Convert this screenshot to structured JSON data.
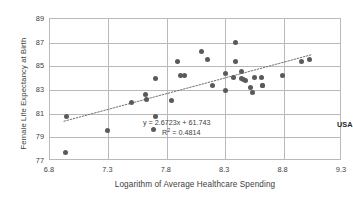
{
  "chart_data": {
    "type": "scatter",
    "title": "",
    "xlabel": "Logarithm of Average Healthcare Spending",
    "ylabel": "Female Life Expectancy at Birth",
    "xlim": [
      6.8,
      9.3
    ],
    "ylim": [
      77,
      89
    ],
    "xticks": [
      "6.8",
      "7.3",
      "7.8",
      "8.3",
      "8.8",
      "9.3"
    ],
    "yticks": [
      "89",
      "87",
      "85",
      "83",
      "81",
      "79",
      "77"
    ],
    "grid": "both",
    "legend": "none",
    "annotations": [
      {
        "name": "regression-equation",
        "text": "y = 2.6723x + 61.743",
        "x": 7.6,
        "y": 80.95
      },
      {
        "name": "r-squared",
        "text": "R² = 0.4814",
        "x": 7.77,
        "y": 80.18
      },
      {
        "name": "usa-label",
        "text": "USA",
        "x": 8.82,
        "y": 80.75
      }
    ],
    "trendline": {
      "type": "linear-dotted",
      "slope": 2.6723,
      "intercept": 61.743,
      "x_start": 6.92,
      "x_end": 9.06
    },
    "series": [
      {
        "name": "Countries",
        "marker": "circle",
        "color": "#5a5a5a",
        "points": [
          {
            "x": 6.93,
            "y": 77.75
          },
          {
            "x": 6.94,
            "y": 80.75
          },
          {
            "x": 7.29,
            "y": 79.55
          },
          {
            "x": 7.5,
            "y": 81.95
          },
          {
            "x": 7.62,
            "y": 82.65
          },
          {
            "x": 7.63,
            "y": 82.2
          },
          {
            "x": 7.7,
            "y": 83.95
          },
          {
            "x": 7.69,
            "y": 79.65
          },
          {
            "x": 7.7,
            "y": 80.75
          },
          {
            "x": 7.84,
            "y": 82.1
          },
          {
            "x": 7.89,
            "y": 85.4
          },
          {
            "x": 7.92,
            "y": 84.25
          },
          {
            "x": 7.95,
            "y": 84.25
          },
          {
            "x": 8.1,
            "y": 86.25
          },
          {
            "x": 8.15,
            "y": 85.6
          },
          {
            "x": 8.19,
            "y": 83.35
          },
          {
            "x": 8.3,
            "y": 84.4
          },
          {
            "x": 8.3,
            "y": 82.95
          },
          {
            "x": 8.39,
            "y": 87.05
          },
          {
            "x": 8.39,
            "y": 85.4
          },
          {
            "x": 8.37,
            "y": 84.05
          },
          {
            "x": 8.44,
            "y": 84.6
          },
          {
            "x": 8.44,
            "y": 84.0
          },
          {
            "x": 8.46,
            "y": 83.85
          },
          {
            "x": 8.47,
            "y": 83.8
          },
          {
            "x": 8.53,
            "y": 82.75
          },
          {
            "x": 8.55,
            "y": 84.05
          },
          {
            "x": 8.52,
            "y": 83.25
          },
          {
            "x": 8.61,
            "y": 84.05
          },
          {
            "x": 8.62,
            "y": 83.4
          },
          {
            "x": 8.62,
            "y": 83.35
          },
          {
            "x": 8.79,
            "y": 84.2
          },
          {
            "x": 8.95,
            "y": 85.4
          },
          {
            "x": 9.02,
            "y": 85.6
          }
        ]
      }
    ]
  }
}
